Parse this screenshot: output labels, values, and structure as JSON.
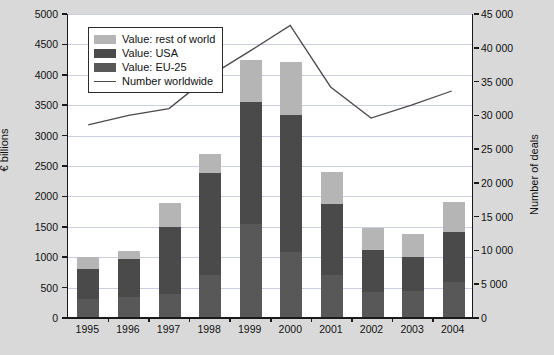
{
  "chart_data": {
    "type": "bar",
    "title": "",
    "subtitle": "",
    "xlabel": "",
    "ylabel": "€ billions",
    "y2label": "Number of deals",
    "categories": [
      "1995",
      "1996",
      "1997",
      "1998",
      "1999",
      "2000",
      "2001",
      "2002",
      "2003",
      "2004"
    ],
    "ylim": [
      0,
      5000
    ],
    "y2lim": [
      0,
      45000
    ],
    "ytick_labels": [
      "0",
      "500",
      "1000",
      "1500",
      "2000",
      "2500",
      "3000",
      "3500",
      "4000",
      "4500",
      "5000"
    ],
    "ytick_values": [
      0,
      500,
      1000,
      1500,
      2000,
      2500,
      3000,
      3500,
      4000,
      4500,
      5000
    ],
    "y2tick_labels": [
      "0",
      "5 000",
      "10 000",
      "15 000",
      "20 000",
      "25 000",
      "30 000",
      "35 000",
      "40 000",
      "45 000"
    ],
    "y2tick_values": [
      0,
      5000,
      10000,
      15000,
      20000,
      25000,
      30000,
      35000,
      40000,
      45000
    ],
    "grid": true,
    "legend_position": "top-left",
    "stacked": true,
    "series": [
      {
        "name": "Value: EU-25",
        "key": "eu25",
        "type": "bar",
        "color": "#585858",
        "axis": "left",
        "values": [
          310,
          350,
          400,
          700,
          1540,
          1090,
          700,
          430,
          440,
          590
        ]
      },
      {
        "name": "Value: USA",
        "key": "usa",
        "type": "bar",
        "color": "#4a4a4a",
        "axis": "left",
        "values": [
          500,
          620,
          1090,
          1680,
          2020,
          2250,
          1170,
          690,
          570,
          830
        ]
      },
      {
        "name": "Value: rest of world",
        "key": "rest_of_world",
        "type": "bar",
        "color": "#b5b5b5",
        "axis": "left",
        "values": [
          190,
          130,
          410,
          320,
          690,
          870,
          530,
          360,
          370,
          490
        ]
      },
      {
        "name": "Number worldwide",
        "key": "number_worldwide",
        "type": "line",
        "color": "#4a4a4a",
        "axis": "right",
        "values": [
          28600,
          30000,
          31000,
          35800,
          39500,
          43300,
          34200,
          29600,
          31500,
          33600
        ]
      }
    ],
    "totals": [
      1000,
      1100,
      1900,
      2700,
      4250,
      4210,
      2400,
      1480,
      1380,
      1910
    ]
  },
  "legend": {
    "entries": [
      {
        "label": "Value: rest of world",
        "swatch": "light-gray-swatch"
      },
      {
        "label": "Value: USA",
        "swatch": "dark-gray-swatch"
      },
      {
        "label": "Value: EU-25",
        "swatch": "medium-gray-swatch"
      },
      {
        "label": "Number worldwide",
        "swatch": "line-swatch"
      }
    ]
  },
  "colors": {
    "rest_of_world": "#b5b5b5",
    "usa": "#4a4a4a",
    "eu25": "#585858",
    "line": "#4a4a4a",
    "grid": "#c9cfe0",
    "axis": "#1a1a1a",
    "plot_background": "#ffffff",
    "page_background": "#d9d9d9"
  }
}
